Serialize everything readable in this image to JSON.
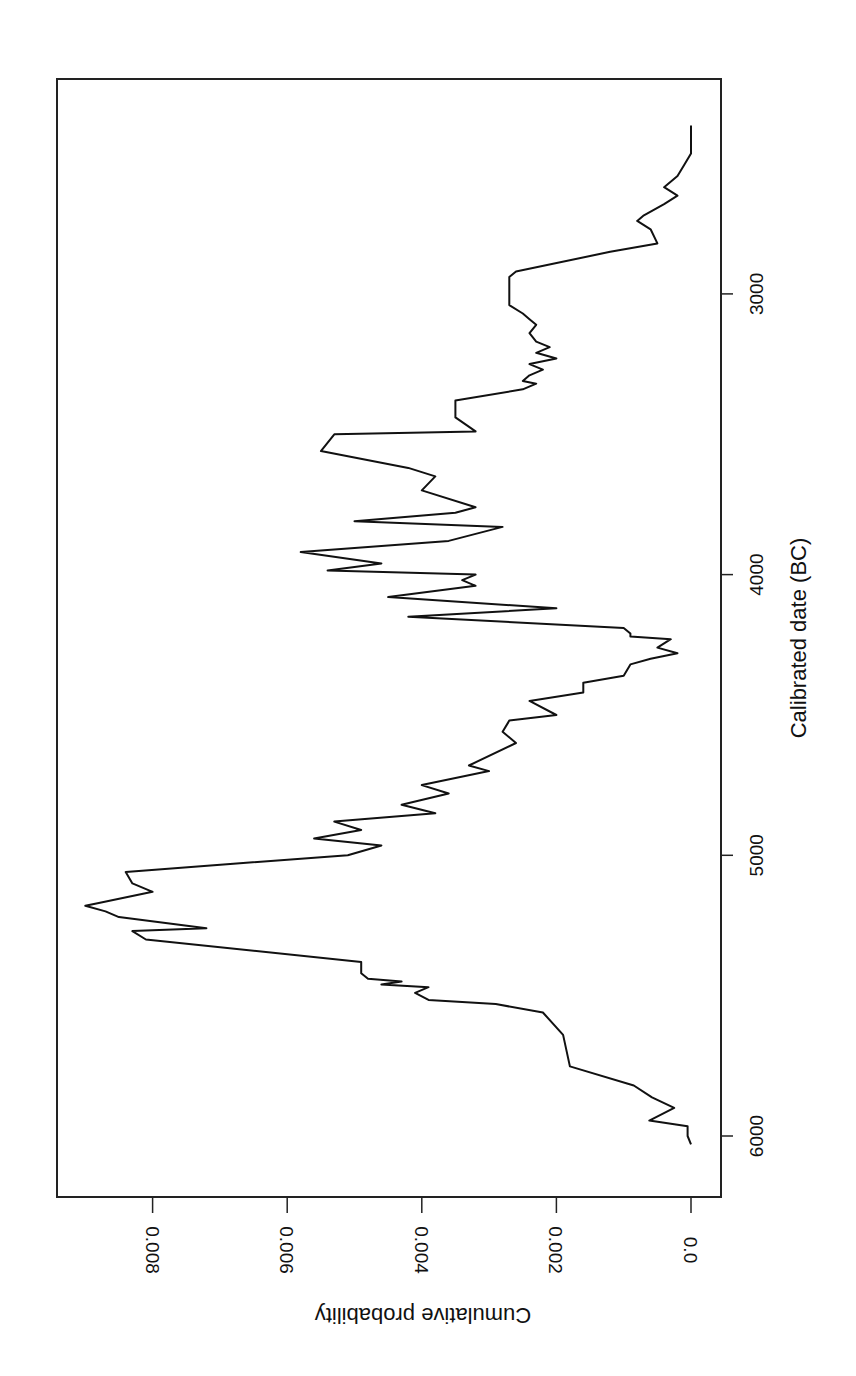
{
  "figure": {
    "orientation": "rotated-90-clockwise",
    "line_color": "#111111",
    "frame_color": "#222222",
    "background": "#ffffff"
  },
  "chart_data": {
    "type": "line",
    "title": "",
    "xlabel": "Calibrated date  (BC)",
    "ylabel": "Cumulative probability",
    "x_ticks": [
      6000,
      5000,
      4000,
      3000
    ],
    "x_tick_labels": [
      "6000",
      "5000",
      "4000",
      "3000"
    ],
    "y_ticks": [
      0.0,
      0.002,
      0.004,
      0.006,
      0.008
    ],
    "y_tick_labels": [
      "0.0",
      "0.002",
      "0.004",
      "0.006",
      "0.008"
    ],
    "xlim": [
      6200,
      2150
    ],
    "ylim": [
      -0.0002,
      0.0094
    ],
    "grid": false,
    "legend": null,
    "series": [
      {
        "name": "Summed probability",
        "x": [
          6030,
          6000,
          5965,
          5945,
          5900,
          5862,
          5820,
          5752,
          5640,
          5560,
          5530,
          5515,
          5490,
          5470,
          5460,
          5450,
          5440,
          5420,
          5380,
          5300,
          5270,
          5260,
          5220,
          5200,
          5180,
          5170,
          5130,
          5100,
          5060,
          5030,
          5000,
          4965,
          4940,
          4910,
          4880,
          4850,
          4820,
          4780,
          4750,
          4700,
          4680,
          4600,
          4560,
          4520,
          4500,
          4450,
          4420,
          4385,
          4360,
          4320,
          4300,
          4280,
          4260,
          4230,
          4220,
          4210,
          4190,
          4150,
          4120,
          4080,
          4040,
          4020,
          4000,
          3985,
          3960,
          3920,
          3880,
          3830,
          3810,
          3780,
          3760,
          3700,
          3650,
          3620,
          3560,
          3500,
          3490,
          3440,
          3400,
          3380,
          3340,
          3320,
          3310,
          3290,
          3270,
          3250,
          3230,
          3210,
          3190,
          3170,
          3140,
          3110,
          3090,
          3070,
          3040,
          3000,
          2940,
          2920,
          2850,
          2820,
          2770,
          2740,
          2720,
          2680,
          2650,
          2620,
          2580,
          2540,
          2500,
          2400
        ],
        "values": [
          0.0,
          5e-05,
          5e-05,
          0.00062,
          0.00025,
          0.00058,
          0.00085,
          0.0018,
          0.0019,
          0.0022,
          0.0029,
          0.0039,
          0.0041,
          0.0039,
          0.0046,
          0.0043,
          0.0048,
          0.0049,
          0.0049,
          0.0081,
          0.0083,
          0.0072,
          0.0085,
          0.0087,
          0.009,
          0.0088,
          0.008,
          0.0083,
          0.0084,
          0.0068,
          0.0051,
          0.0046,
          0.0056,
          0.0049,
          0.0053,
          0.0038,
          0.0043,
          0.0036,
          0.004,
          0.003,
          0.0033,
          0.0026,
          0.0028,
          0.0027,
          0.002,
          0.0024,
          0.0016,
          0.0016,
          0.001,
          0.0009,
          0.0006,
          0.0002,
          0.0005,
          0.0003,
          0.0009,
          0.0009,
          0.001,
          0.0042,
          0.002,
          0.0045,
          0.0032,
          0.0034,
          0.0032,
          0.0054,
          0.0046,
          0.0058,
          0.0036,
          0.0028,
          0.005,
          0.0035,
          0.0032,
          0.004,
          0.0038,
          0.0042,
          0.0055,
          0.0053,
          0.0032,
          0.0035,
          0.0035,
          0.0035,
          0.0025,
          0.0023,
          0.0025,
          0.0024,
          0.0022,
          0.0024,
          0.002,
          0.0023,
          0.0021,
          0.0023,
          0.0024,
          0.0023,
          0.0024,
          0.0025,
          0.0027,
          0.0027,
          0.0027,
          0.0026,
          0.0012,
          0.0005,
          0.0006,
          0.0008,
          0.0007,
          0.0004,
          0.0002,
          0.0004,
          0.0002,
          0.0001,
          0.0,
          0.0
        ],
        "color": "#111111"
      }
    ],
    "annotations": []
  }
}
